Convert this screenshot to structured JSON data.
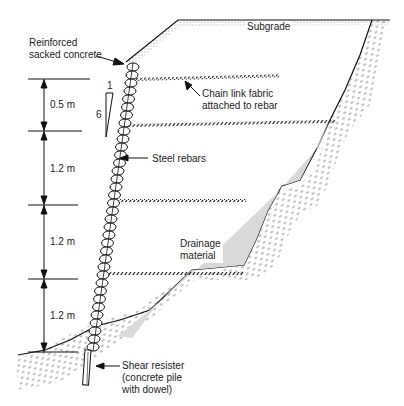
{
  "diagram": {
    "labels": {
      "sacked_concrete_l1": "Reinforced",
      "sacked_concrete_l2": "sacked concrete",
      "subgrade": "Subgrade",
      "chain_link_l1": "Chain link fabric",
      "chain_link_l2": "attached to rebar",
      "steel_rebars": "Steel rebars",
      "drainage_l1": "Drainage",
      "drainage_l2": "material",
      "shear_l1": "Shear resister",
      "shear_l2": "(concrete pile",
      "shear_l3": "with dowel)",
      "slope_rise": "6",
      "slope_run": "1"
    },
    "dimensions": [
      {
        "label": "0.5  m"
      },
      {
        "label": "1.2  m"
      },
      {
        "label": "1.2  m"
      },
      {
        "label": "1.2  m"
      }
    ],
    "colors": {
      "line": "#111111",
      "drainage_fill": "#d9d9d9",
      "hatch": "#555555"
    }
  }
}
